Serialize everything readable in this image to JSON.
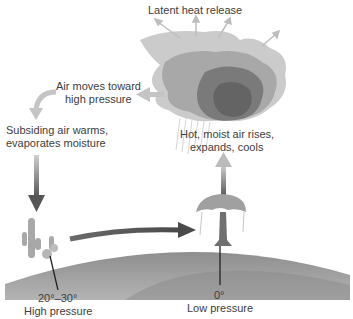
{
  "diagram": {
    "labels": {
      "latent_heat": "Latent heat release",
      "air_moves_1": "Air moves toward",
      "air_moves_2": "high pressure",
      "subsiding_1": "Subsiding air warms,",
      "subsiding_2": "evaporates moisture",
      "rising_1": "Hot, moist air rises,",
      "rising_2": "expands, cools",
      "high_lat": "20°–30°",
      "high_pressure": "High pressure",
      "low_lat": "0°",
      "low_pressure": "Low pressure"
    },
    "colors": {
      "ground": "#9a9a9a",
      "cloud_light": "#c8c8c8",
      "cloud_mid": "#9e9e9e",
      "cloud_dark": "#6e6e6e",
      "arrow_light": "#c4c4c4",
      "arrow_dark": "#555555"
    }
  }
}
